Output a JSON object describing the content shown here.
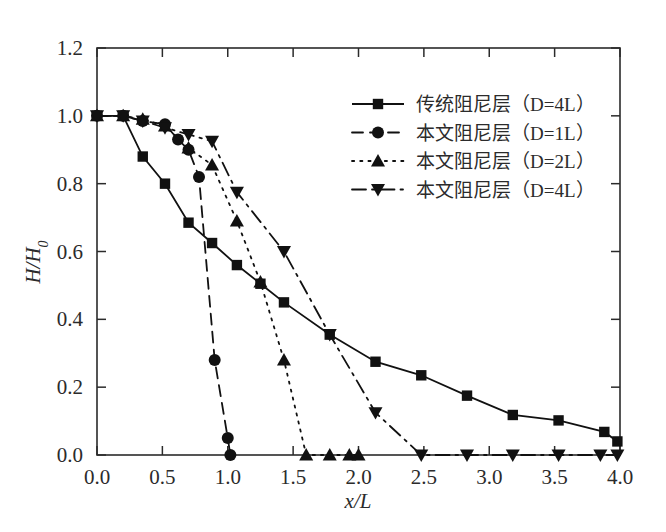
{
  "figure": {
    "background_color": "#ffffff",
    "foreground_color": "#111111",
    "width": 666,
    "height": 532
  },
  "chart_data": {
    "type": "line",
    "title": "",
    "subtitle": "",
    "xlabel": "x/L",
    "ylabel": "H/H0",
    "ylabel_display": "H/H",
    "ylabel_subscript": "0",
    "xlim": [
      0.0,
      4.0
    ],
    "ylim": [
      0.0,
      1.2
    ],
    "xticks": [
      0.0,
      0.5,
      1.0,
      1.5,
      2.0,
      2.5,
      3.0,
      3.5,
      4.0
    ],
    "xtick_labels": [
      "0.0",
      "0.5",
      "1.0",
      "1.5",
      "2.0",
      "2.5",
      "3.0",
      "3.5",
      "4.0"
    ],
    "yticks": [
      0.0,
      0.2,
      0.4,
      0.6,
      0.8,
      1.0,
      1.2
    ],
    "ytick_labels": [
      "0.0",
      "0.2",
      "0.4",
      "0.6",
      "0.8",
      "1.0",
      "1.2"
    ],
    "grid": false,
    "legend_position": "upper right",
    "series": [
      {
        "name": "传统阻尼层（D=4L）",
        "marker": "square",
        "linestyle": "solid",
        "color": "#111111",
        "x": [
          0.0,
          0.2,
          0.35,
          0.52,
          0.7,
          0.88,
          1.07,
          1.25,
          1.43,
          1.78,
          2.13,
          2.48,
          2.83,
          3.18,
          3.53,
          3.88,
          3.98
        ],
        "y": [
          1.0,
          1.0,
          0.88,
          0.8,
          0.685,
          0.625,
          0.56,
          0.505,
          0.45,
          0.355,
          0.275,
          0.235,
          0.175,
          0.118,
          0.102,
          0.068,
          0.04
        ]
      },
      {
        "name": "本文阻尼层（D=1L）",
        "marker": "circle",
        "linestyle": "dashed",
        "color": "#111111",
        "x": [
          0.0,
          0.2,
          0.35,
          0.52,
          0.62,
          0.7,
          0.78,
          0.9,
          1.0,
          1.02
        ],
        "y": [
          1.0,
          1.0,
          0.985,
          0.975,
          0.93,
          0.9,
          0.82,
          0.28,
          0.05,
          0.0
        ]
      },
      {
        "name": "本文阻尼层（D=2L）",
        "marker": "triangle-up",
        "linestyle": "dotted",
        "color": "#111111",
        "x": [
          0.0,
          0.2,
          0.35,
          0.52,
          0.7,
          0.88,
          1.07,
          1.25,
          1.43,
          1.6,
          1.78,
          1.93,
          2.0
        ],
        "y": [
          1.0,
          1.0,
          0.99,
          0.97,
          0.905,
          0.855,
          0.69,
          0.51,
          0.28,
          0.0,
          0.0,
          0.0,
          0.0
        ]
      },
      {
        "name": "本文阻尼层（D=4L）",
        "marker": "triangle-down",
        "linestyle": "dashdot",
        "color": "#111111",
        "x": [
          0.0,
          0.2,
          0.35,
          0.52,
          0.7,
          0.88,
          1.07,
          1.43,
          1.78,
          2.13,
          2.48,
          2.83,
          3.18,
          3.53,
          3.85,
          3.98
        ],
        "y": [
          1.0,
          1.0,
          0.985,
          0.965,
          0.945,
          0.925,
          0.775,
          0.6,
          0.355,
          0.125,
          0.0,
          0.0,
          0.0,
          0.0,
          0.0,
          0.0
        ]
      }
    ]
  },
  "legend": {
    "entries": [
      {
        "label": "传统阻尼层（D=4L）",
        "marker": "square",
        "linestyle": "solid"
      },
      {
        "label": "本文阻尼层（D=1L）",
        "marker": "circle",
        "linestyle": "dashed"
      },
      {
        "label": "本文阻尼层（D=2L）",
        "marker": "triangle-up",
        "linestyle": "dotted"
      },
      {
        "label": "本文阻尼层（D=4L）",
        "marker": "triangle-down",
        "linestyle": "dashdot"
      }
    ]
  }
}
